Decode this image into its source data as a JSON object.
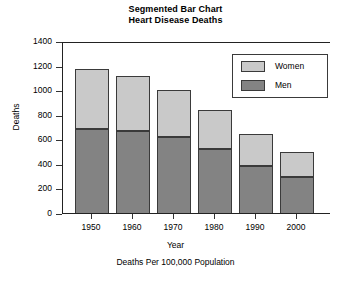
{
  "chart_data": {
    "type": "bar",
    "subtype": "stacked",
    "title": "Segmented Bar Chart",
    "subtitle": "Heart Disease Deaths",
    "caption": "Deaths Per 100,000 Population",
    "xlabel": "Year",
    "ylabel": "Deaths",
    "categories": [
      "1950",
      "1960",
      "1970",
      "1980",
      "1990",
      "2000"
    ],
    "series": [
      {
        "name": "Men",
        "color": "#838383",
        "values": [
          692,
          676,
          627,
          529,
          391,
          301
        ]
      },
      {
        "name": "Women",
        "color": "#c9c9c9",
        "values": [
          488,
          447,
          382,
          318,
          260,
          204
        ]
      }
    ],
    "totals": [
      1180,
      1123,
      1009,
      847,
      651,
      505
    ],
    "ylim": [
      0,
      1400
    ],
    "yticks": [
      "0",
      "200",
      "400",
      "600",
      "800",
      "1000",
      "1200",
      "1400"
    ],
    "ytick_values": [
      0,
      200,
      400,
      600,
      800,
      1000,
      1200,
      1400
    ],
    "grid": false,
    "legend_position": "top-right",
    "legend_entries": [
      "Women",
      "Men"
    ]
  },
  "legend": {
    "rows": [
      {
        "label": "Women",
        "color": "#c9c9c9"
      },
      {
        "label": "Men",
        "color": "#838383"
      }
    ]
  },
  "colors": {
    "men": "#838383",
    "women": "#c9c9c9",
    "axis": "#222222",
    "background": "#ffffff"
  }
}
